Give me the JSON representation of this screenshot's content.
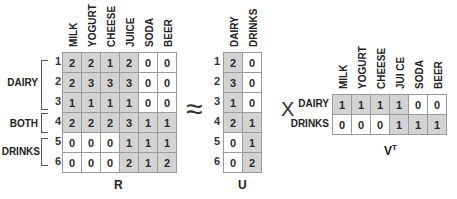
{
  "R": {
    "label": "R",
    "columns": [
      "MILK",
      "YOGURT",
      "CHEESE",
      "JUICE",
      "SODA",
      "BEER"
    ],
    "row_indices": [
      "1",
      "2",
      "3",
      "4",
      "5",
      "6"
    ],
    "groups": [
      {
        "label": "DAIRY",
        "rows": [
          1,
          3
        ]
      },
      {
        "label": "BOTH",
        "rows": [
          4,
          4
        ]
      },
      {
        "label": "DRINKS",
        "rows": [
          5,
          6
        ]
      }
    ],
    "values": [
      [
        2,
        2,
        1,
        2,
        0,
        0
      ],
      [
        2,
        3,
        3,
        3,
        0,
        0
      ],
      [
        1,
        1,
        1,
        1,
        0,
        0
      ],
      [
        2,
        2,
        2,
        3,
        1,
        1
      ],
      [
        0,
        0,
        0,
        1,
        1,
        1
      ],
      [
        0,
        0,
        0,
        2,
        1,
        2
      ]
    ],
    "shaded": [
      [
        1,
        1,
        1,
        1,
        0,
        0
      ],
      [
        1,
        1,
        1,
        1,
        0,
        0
      ],
      [
        1,
        1,
        1,
        1,
        0,
        0
      ],
      [
        1,
        1,
        1,
        1,
        1,
        1
      ],
      [
        0,
        0,
        0,
        1,
        1,
        1
      ],
      [
        0,
        0,
        0,
        1,
        1,
        1
      ]
    ]
  },
  "approx_symbol": "≈",
  "U": {
    "label": "U",
    "columns": [
      "DAIRY",
      "DRINKS"
    ],
    "row_indices": [
      "1",
      "2",
      "3",
      "4",
      "5",
      "6"
    ],
    "values": [
      [
        2,
        0
      ],
      [
        3,
        0
      ],
      [
        1,
        0
      ],
      [
        2,
        1
      ],
      [
        0,
        1
      ],
      [
        0,
        2
      ]
    ],
    "shaded": [
      [
        1,
        0
      ],
      [
        1,
        0
      ],
      [
        1,
        0
      ],
      [
        1,
        1
      ],
      [
        0,
        1
      ],
      [
        0,
        1
      ]
    ]
  },
  "times_symbol": "X",
  "VT": {
    "label": "V",
    "label_sup": "T",
    "columns": [
      "MILK",
      "YOGURT",
      "CHEESE",
      "JUI CE",
      "SODA",
      "BEER"
    ],
    "rows": [
      "DAIRY",
      "DRINKS"
    ],
    "values": [
      [
        1,
        1,
        1,
        1,
        0,
        0
      ],
      [
        0,
        0,
        0,
        1,
        1,
        1
      ]
    ],
    "shaded": [
      [
        1,
        1,
        1,
        1,
        0,
        0
      ],
      [
        0,
        0,
        0,
        1,
        1,
        1
      ]
    ]
  }
}
